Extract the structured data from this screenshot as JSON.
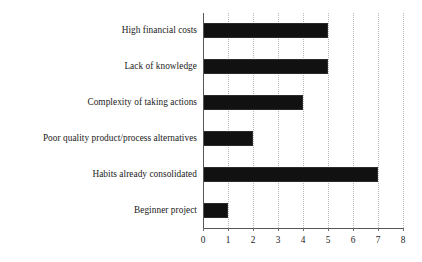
{
  "chart_data": {
    "type": "bar",
    "orientation": "horizontal",
    "title": "",
    "xlabel": "",
    "ylabel": "",
    "categories": [
      "High financial costs",
      "Lack of knowledge",
      "Complexity of taking actions",
      "Poor quality product/process alternatives",
      "Habits already consolidated",
      "Beginner project"
    ],
    "values": [
      5,
      5,
      4,
      2,
      7,
      1
    ],
    "xlim": [
      0,
      8
    ],
    "xticks": [
      0,
      1,
      2,
      3,
      4,
      5,
      6,
      7,
      8
    ],
    "xtick_labels": [
      "0",
      "1",
      "2",
      "3",
      "4",
      "5",
      "6",
      "7",
      "8"
    ],
    "grid": true,
    "grid_axis": "x",
    "legend": false,
    "bar_color": "#111111",
    "grid_color": "#b9b9b9",
    "axis_color": "#575757",
    "background_color": "#ffffff"
  }
}
